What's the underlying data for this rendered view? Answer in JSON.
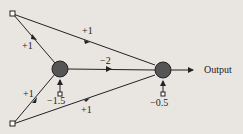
{
  "diagram": {
    "nodes": {
      "input1": {
        "label": ""
      },
      "input2": {
        "label": ""
      },
      "hidden": {
        "label": ""
      },
      "output": {
        "label": "Output"
      }
    },
    "weights": {
      "in1_hidden": "+1",
      "in1_output": "+1",
      "in2_hidden": "+1",
      "in2_output": "+1",
      "hidden_output": "−2"
    },
    "biases": {
      "hidden": "−1.5",
      "output": "−0.5"
    },
    "colors": {
      "node": "#555555",
      "line": "#222222",
      "background": "#e9e6e1"
    }
  }
}
